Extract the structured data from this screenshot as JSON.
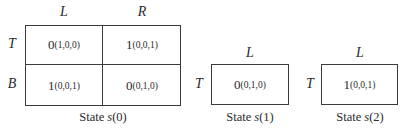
{
  "games": [
    {
      "state_label_prefix": "State ",
      "state_var": "s",
      "state_index": "(0)",
      "column_labels": [
        "L",
        "R"
      ],
      "row_labels": [
        "T",
        "B"
      ],
      "cells": [
        [
          {
            "payoff": "0",
            "transition": "(1,0,0)"
          },
          {
            "payoff": "1",
            "transition": "(0,0,1)"
          }
        ],
        [
          {
            "payoff": "1",
            "transition": "(0,0,1)"
          },
          {
            "payoff": "0",
            "transition": "(0,1,0)"
          }
        ]
      ]
    },
    {
      "state_label_prefix": "State ",
      "state_var": "s",
      "state_index": "(1)",
      "column_labels": [
        "L"
      ],
      "row_labels": [
        "T"
      ],
      "cells": [
        [
          {
            "payoff": "0",
            "transition": "(0,1,0)"
          }
        ]
      ]
    },
    {
      "state_label_prefix": "State ",
      "state_var": "s",
      "state_index": "(2)",
      "column_labels": [
        "L"
      ],
      "row_labels": [
        "T"
      ],
      "cells": [
        [
          {
            "payoff": "1",
            "transition": "(0,0,1)"
          }
        ]
      ]
    }
  ]
}
